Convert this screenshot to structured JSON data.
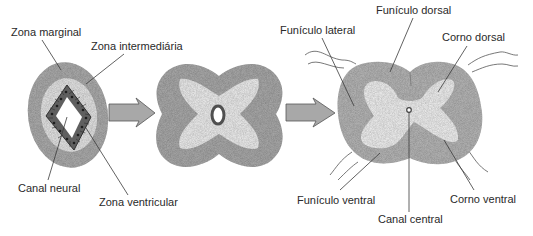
{
  "figure": {
    "stages": [
      {
        "name": "early-neural-tube",
        "labels": {
          "zona_marginal": "Zona marginal",
          "zona_intermediaria": "Zona intermediária",
          "canal_neural": "Canal neural",
          "zona_ventricular": "Zona ventricular"
        }
      },
      {
        "name": "intermediate-stage",
        "labels": {}
      },
      {
        "name": "spinal-cord",
        "labels": {
          "funiculo_dorsal": "Funículo dorsal",
          "funiculo_lateral": "Funículo lateral",
          "corno_dorsal": "Corno dorsal",
          "funiculo_ventral": "Funículo ventral",
          "corno_ventral": "Corno ventral",
          "canal_central": "Canal central"
        }
      }
    ],
    "arrows": [
      "arrow-right-icon",
      "arrow-right-icon"
    ],
    "colors": {
      "marginal": "#a9a9a9",
      "intermediate": "#e2e2e2",
      "ventricular": "#5e5e5e",
      "lumen": "#ffffff",
      "arrow_fill": "#a8a8a8",
      "arrow_stroke": "#555555",
      "grey_matter": "#ececec",
      "white_matter": "#b3b3b3"
    }
  }
}
